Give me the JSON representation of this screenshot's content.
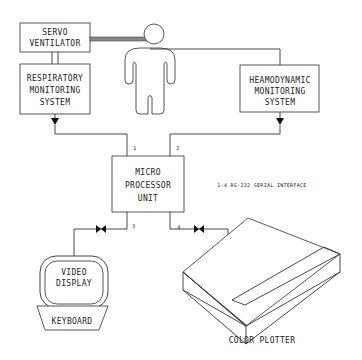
{
  "diagram": {
    "nodes": {
      "servo_ventilator": [
        "SERVO",
        "VENTILATOR"
      ],
      "respiratory": [
        "RESPIRATORY",
        "MONITORING",
        "SYSTEM"
      ],
      "heamodynamic": [
        "HEAMODYNAMIC",
        "MONITORING",
        "SYSTEM"
      ],
      "micro": [
        "MICRO",
        "PROCESSOR",
        "UNIT"
      ],
      "video": [
        "VIDEO",
        "DISPLAY"
      ],
      "keyboard": "KEYBOARD",
      "plotter": "COLOR PLOTTER",
      "patient": "patient-figure"
    },
    "ports": {
      "p1": "1",
      "p2": "2",
      "p3": "3",
      "p4": "4"
    },
    "legend": "1-4 RS-232 SERIAL INTERFACE"
  }
}
